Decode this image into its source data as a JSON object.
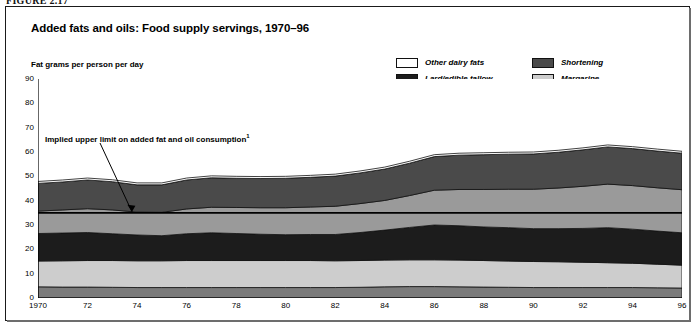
{
  "figure_number": "FIGURE 2.17",
  "title": "Added fats and oils: Food supply servings, 1970–96",
  "y_axis_label": "Fat grams per person per day",
  "annotation": {
    "text": "Implied upper limit on added fat and oil consumption",
    "footnote_marker": "1",
    "reference_value": 35
  },
  "legend": {
    "column1": [
      {
        "label": "Other dairy fats",
        "color": "#ffffff"
      },
      {
        "label": "Lard/edible tallow",
        "color": "#1c1c1c"
      },
      {
        "label": "Salad and cooking",
        "color": "#9a9a9a"
      }
    ],
    "column2": [
      {
        "label": "Shortening",
        "color": "#4a4a4a"
      },
      {
        "label": "Margarine",
        "color": "#cdcdcd"
      },
      {
        "label": "Butter",
        "color": "#7b7b7b"
      }
    ]
  },
  "chart_data": {
    "type": "area",
    "stacked": true,
    "title": "Added fats and oils: Food supply servings, 1970–96",
    "xlabel": "",
    "ylabel": "Fat grams per person per day",
    "ylim": [
      0,
      90
    ],
    "xlim": [
      1970,
      1996
    ],
    "y_ticks": [
      0,
      10,
      20,
      30,
      40,
      50,
      60,
      70,
      80,
      90
    ],
    "x_ticks": [
      1970,
      1972,
      1974,
      1976,
      1978,
      1980,
      1982,
      1984,
      1986,
      1988,
      1990,
      1992,
      1994,
      1996
    ],
    "x_tick_labels": [
      "1970",
      "72",
      "74",
      "76",
      "78",
      "80",
      "82",
      "84",
      "86",
      "88",
      "90",
      "92",
      "94",
      "96"
    ],
    "grid": false,
    "legend_position": "top-right",
    "x": [
      1970,
      1971,
      1972,
      1973,
      1974,
      1975,
      1976,
      1977,
      1978,
      1979,
      1980,
      1981,
      1982,
      1983,
      1984,
      1985,
      1986,
      1987,
      1988,
      1989,
      1990,
      1991,
      1992,
      1993,
      1994,
      1995,
      1996
    ],
    "series": [
      {
        "name": "Butter",
        "color": "#7b7b7b",
        "values": [
          4.6,
          4.5,
          4.5,
          4.4,
          4.3,
          4.3,
          4.3,
          4.3,
          4.3,
          4.3,
          4.3,
          4.3,
          4.3,
          4.4,
          4.6,
          4.7,
          4.7,
          4.6,
          4.5,
          4.4,
          4.3,
          4.3,
          4.3,
          4.3,
          4.3,
          4.2,
          4.1
        ]
      },
      {
        "name": "Margarine",
        "color": "#cdcdcd",
        "values": [
          10.6,
          10.8,
          10.9,
          11.0,
          11.0,
          11.0,
          11.1,
          11.1,
          11.1,
          11.1,
          11.1,
          11.1,
          11.0,
          11.0,
          11.0,
          11.0,
          11.0,
          11.0,
          10.9,
          10.8,
          10.7,
          10.6,
          10.4,
          10.2,
          10.0,
          9.7,
          9.4
        ]
      },
      {
        "name": "Lard/edible tallow",
        "color": "#1c1c1c",
        "values": [
          11.3,
          11.4,
          11.5,
          11.0,
          10.6,
          10.3,
          11.0,
          11.4,
          11.1,
          10.8,
          10.6,
          10.7,
          10.8,
          11.5,
          12.3,
          13.3,
          14.3,
          14.1,
          13.8,
          13.7,
          13.5,
          13.6,
          13.9,
          14.4,
          14.0,
          13.6,
          13.3
        ]
      },
      {
        "name": "Salad and cooking",
        "color": "#9a9a9a",
        "values": [
          9.2,
          9.5,
          9.8,
          9.8,
          9.4,
          9.6,
          10.2,
          10.5,
          10.7,
          10.9,
          11.1,
          11.3,
          11.6,
          11.9,
          12.2,
          13.1,
          14.3,
          14.9,
          15.4,
          15.8,
          16.2,
          16.7,
          17.3,
          17.9,
          17.9,
          17.8,
          17.7
        ]
      },
      {
        "name": "Shortening",
        "color": "#4a4a4a",
        "values": [
          11.4,
          11.5,
          11.8,
          11.6,
          11.2,
          11.3,
          11.9,
          12.1,
          12.0,
          12.0,
          12.1,
          12.2,
          12.4,
          12.6,
          12.9,
          13.3,
          13.8,
          14.1,
          14.3,
          14.4,
          14.5,
          14.7,
          15.0,
          15.3,
          15.2,
          15.1,
          15.0
        ]
      },
      {
        "name": "Other dairy fats",
        "color": "#ffffff",
        "values": [
          0.8,
          0.8,
          0.8,
          0.8,
          0.8,
          0.8,
          0.8,
          0.8,
          0.8,
          0.8,
          0.8,
          0.8,
          0.8,
          0.8,
          0.8,
          0.8,
          0.8,
          0.8,
          0.8,
          0.8,
          0.8,
          0.8,
          0.8,
          0.8,
          0.8,
          0.8,
          0.8
        ]
      }
    ],
    "totals": [
      47.9,
      48.5,
      49.3,
      48.6,
      47.3,
      47.3,
      49.3,
      50.2,
      50.0,
      49.9,
      50.0,
      50.4,
      50.9,
      52.2,
      53.8,
      56.2,
      58.9,
      59.5,
      59.7,
      59.9,
      60.0,
      60.7,
      61.7,
      62.9,
      62.2,
      61.2,
      60.3
    ]
  }
}
